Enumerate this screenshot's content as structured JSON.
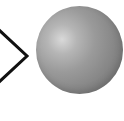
{
  "diagram": {
    "elements": [
      {
        "type": "chevron-arrow",
        "direction": "right",
        "color": "#111111"
      },
      {
        "type": "sphere",
        "shading": "grayscale",
        "base_color": "#8a8a8a",
        "highlight_color": "#d9d9d9"
      }
    ]
  }
}
